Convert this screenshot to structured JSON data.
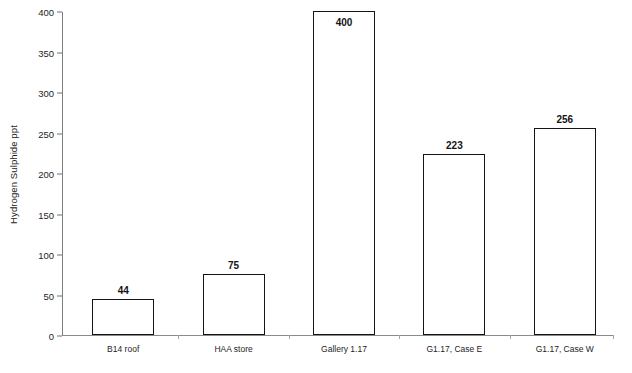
{
  "chart_data": {
    "type": "bar",
    "title": "",
    "subtitle": "",
    "xlabel": "",
    "ylabel": "Hydrogen Sulphide ppt",
    "categories": [
      "B14 roof",
      "HAA store",
      "Gallery 1.17",
      "G1.17, Case E",
      "G1.17, Case W"
    ],
    "values": [
      44,
      75,
      400,
      223,
      256
    ],
    "value_labels": [
      "44",
      "75",
      "400",
      "223",
      "256"
    ],
    "ylim": [
      0,
      400
    ],
    "yticks": [
      0,
      50,
      100,
      150,
      200,
      250,
      300,
      350,
      400
    ],
    "ytick_labels": [
      "0",
      "50",
      "100",
      "150",
      "200",
      "250",
      "300",
      "350",
      "400"
    ],
    "grid": false,
    "legend": false,
    "legend_position": "none",
    "bar_fill_color": "#ffffff",
    "bar_edge_color": "#141414",
    "axis_color": "#8a8a8a",
    "text_color": "#1d1d1d",
    "background_color": "#ffffff"
  }
}
